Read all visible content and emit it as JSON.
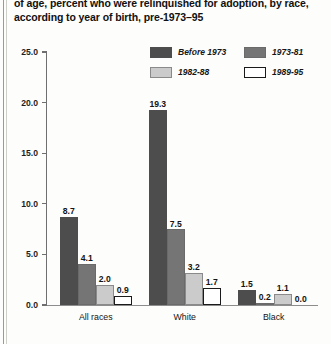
{
  "title_lines": [
    "of age, percent who were relinquished for adoption, by race,",
    "according to year of birth, pre-1973–95"
  ],
  "legend": [
    {
      "label": "Before 1973",
      "color": "#4d4d4d",
      "border": "#4d4d4d"
    },
    {
      "label": "1973-81",
      "color": "#757575",
      "border": "#6a6a6a"
    },
    {
      "label": "1982-88",
      "color": "#cbcbcb",
      "border": "#8a8a8a"
    },
    {
      "label": "1989-95",
      "color": "#ffffff",
      "border": "#1a1a1a"
    }
  ],
  "chart_data": {
    "type": "bar",
    "title": "of age, percent who were relinquished for adoption, by race, according to year of birth, pre-1973–95",
    "xlabel": "",
    "ylabel": "",
    "ylim": [
      0.0,
      25.0
    ],
    "yticks": [
      "0.0",
      "5.0",
      "10.0",
      "15.0",
      "20.0",
      "25.0"
    ],
    "ytick_values": [
      0.0,
      5.0,
      10.0,
      15.0,
      20.0,
      25.0
    ],
    "grid": false,
    "legend_position": "top-right",
    "categories": [
      "All races",
      "White",
      "Black"
    ],
    "series": [
      {
        "name": "Before 1973",
        "values": [
          8.7,
          19.3,
          1.5
        ],
        "labels": [
          "8.7",
          "19.3",
          "1.5"
        ]
      },
      {
        "name": "1973-81",
        "values": [
          4.1,
          7.5,
          0.2
        ],
        "labels": [
          "4.1",
          "7.5",
          "0.2"
        ]
      },
      {
        "name": "1982-88",
        "values": [
          2.0,
          3.2,
          1.1
        ],
        "labels": [
          "2.0",
          "3.2",
          "1.1"
        ]
      },
      {
        "name": "1989-95",
        "values": [
          0.9,
          1.7,
          0.0
        ],
        "labels": [
          "0.9",
          "1.7",
          "0.0"
        ]
      }
    ]
  }
}
